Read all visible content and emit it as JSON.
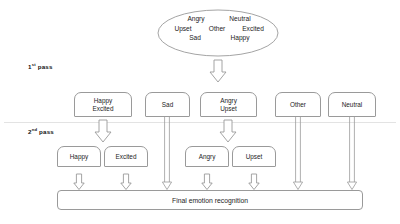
{
  "diagram": {
    "pass_labels": [
      {
        "ordinal": "1",
        "suffix": "st",
        "text": " pass"
      },
      {
        "ordinal": "2",
        "suffix": "nd",
        "text": " pass"
      }
    ],
    "source_ellipse": {
      "name": "all-emotions-ellipse",
      "rows": [
        [
          "Angry",
          "Neutral"
        ],
        [
          "Upset",
          "Other",
          "Excited"
        ],
        [
          "Sad",
          "Happy"
        ]
      ],
      "all_labels": [
        "Angry",
        "Neutral",
        "Upset",
        "Other",
        "Excited",
        "Sad",
        "Happy"
      ]
    },
    "first_pass_nodes": [
      {
        "id": "happy-excited",
        "lines": [
          "Happy",
          "Excited"
        ]
      },
      {
        "id": "sad",
        "lines": [
          "Sad"
        ]
      },
      {
        "id": "angry-upset",
        "lines": [
          "Angry",
          "Upset"
        ]
      },
      {
        "id": "other",
        "lines": [
          "Other"
        ]
      },
      {
        "id": "neutral",
        "lines": [
          "Neutral"
        ]
      }
    ],
    "second_pass_nodes": [
      {
        "id": "happy",
        "lines": [
          "Happy"
        ]
      },
      {
        "id": "excited",
        "lines": [
          "Excited"
        ]
      },
      {
        "id": "angry",
        "lines": [
          "Angry"
        ]
      },
      {
        "id": "upset",
        "lines": [
          "Upset"
        ]
      }
    ],
    "final_node": {
      "id": "final-emotion-recognition",
      "label": "Final emotion recognition"
    },
    "colors": {
      "stroke": "#9a9a9a",
      "text": "#1c1c1c",
      "background": "#ffffff",
      "divider": "#d8d8d8"
    }
  }
}
